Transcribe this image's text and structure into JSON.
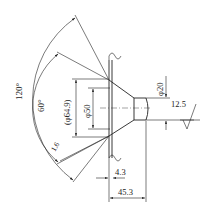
{
  "drawing": {
    "title": "",
    "colors": {
      "line": "#222222",
      "background": "#ffffff"
    },
    "dimensions": {
      "angle_outer": "120°",
      "angle_inner": "60°",
      "chamfer": "1.6",
      "dia_outer_ref": "(φ64.9)",
      "dia_face": "φ50",
      "dia_pilot": "φ20",
      "roughness": "12.5",
      "len_short": "4.3",
      "len_total": "45.3"
    }
  }
}
